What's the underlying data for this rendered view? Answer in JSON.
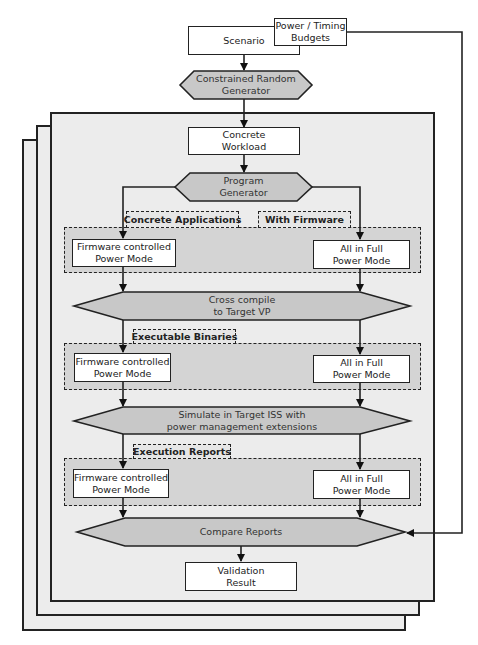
{
  "inputs": {
    "scenario": "Scenario",
    "budgets": "Power / Timing\nBudgets"
  },
  "nodes": {
    "constrained_random_generator": "Constrained Random\nGenerator",
    "concrete_workload": "Concrete\nWorkload",
    "program_generator": "Program\nGenerator",
    "cross_compile": "Cross compile\nto Target VP",
    "simulate": "Simulate in Target ISS with\npower management extensions",
    "compare_reports": "Compare Reports",
    "validation_result": "Validation\nResult"
  },
  "groups": [
    {
      "labels": [
        "Concrete Applications",
        "With Firmware"
      ],
      "left": "Firmware controlled\nPower Mode",
      "right": "All in Full\nPower Mode"
    },
    {
      "labels": [
        "Executable Binaries"
      ],
      "left": "Firmware controlled\nPower Mode",
      "right": "All in Full\nPower Mode"
    },
    {
      "labels": [
        "Execution Reports"
      ],
      "left": "Firmware controlled\nPower Mode",
      "right": "All in Full\nPower Mode"
    }
  ],
  "colors": {
    "process_fill": "#c8c8c8",
    "page_fill": "#ececec",
    "group_fill": "#d4d4d4",
    "stroke": "#222222"
  }
}
